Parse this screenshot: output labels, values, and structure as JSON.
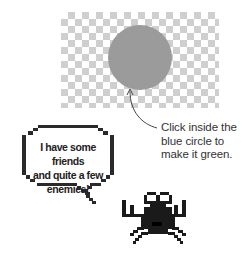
{
  "canvas": {
    "checker_color": "#cfcfcf",
    "circle_color": "#9b9b9b"
  },
  "hint": {
    "lines": [
      "Click inside the",
      "blue circle to",
      "make it green."
    ]
  },
  "speech_bubble": {
    "lines": [
      "I have some friends",
      "and quite a few",
      "enemies!"
    ]
  },
  "character": {
    "name": "crab-monster",
    "color": "#1a1a1a"
  }
}
